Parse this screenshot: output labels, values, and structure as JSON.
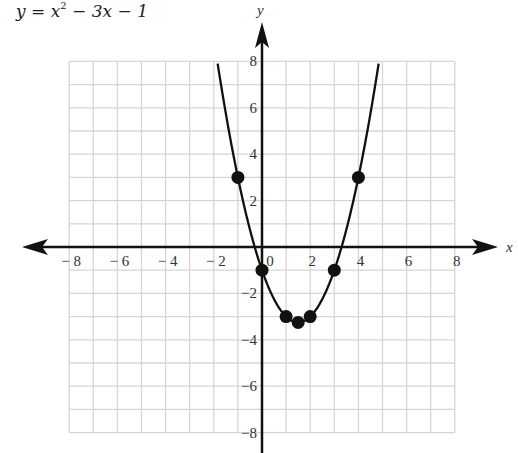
{
  "title_parts": {
    "lhs": "y = x",
    "exp": "2",
    "rhs": " − 3x − 1"
  },
  "chart_data": {
    "type": "line",
    "xlabel": "x",
    "ylabel": "y",
    "xlim": [
      -8,
      8
    ],
    "ylim": [
      -8,
      8
    ],
    "grid": true,
    "x_ticks": [
      "-8",
      "-6",
      "-4",
      "-2",
      "0",
      "2",
      "4",
      "6",
      "8"
    ],
    "y_ticks": [
      "8",
      "6",
      "4",
      "2",
      "-2",
      "-4",
      "-6",
      "-8"
    ],
    "series": [
      {
        "name": "y = x^2 - 3x - 1",
        "function": "x^2 - 3x - 1",
        "points": [
          {
            "x": -1,
            "y": 3
          },
          {
            "x": 0,
            "y": -1
          },
          {
            "x": 1,
            "y": -3
          },
          {
            "x": 1.5,
            "y": -3.25
          },
          {
            "x": 2,
            "y": -3
          },
          {
            "x": 3,
            "y": -1
          },
          {
            "x": 4,
            "y": 3
          }
        ]
      }
    ]
  },
  "colors": {
    "grid": "#d6d6d6",
    "curve": "#111111",
    "axis": "#111111"
  }
}
